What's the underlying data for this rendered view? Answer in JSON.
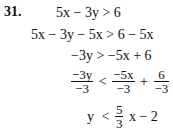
{
  "problem": {
    "number": "31.",
    "steps": {
      "s1": "5x − 3y > 6",
      "s2": "5x − 3y − 5x > 6 − 5x",
      "s3": "−3y > −5x + 6",
      "s4": {
        "lhs_num": "−3y",
        "lhs_den": "−3",
        "rel": "<",
        "t1_num": "−5x",
        "t1_den": "−3",
        "plus": "+",
        "t2_num": "6",
        "t2_den": "−3"
      },
      "s5": {
        "lhs": "y",
        "rel": "<",
        "coef_num": "5",
        "coef_den": "3",
        "rest": "x − 2"
      }
    }
  }
}
